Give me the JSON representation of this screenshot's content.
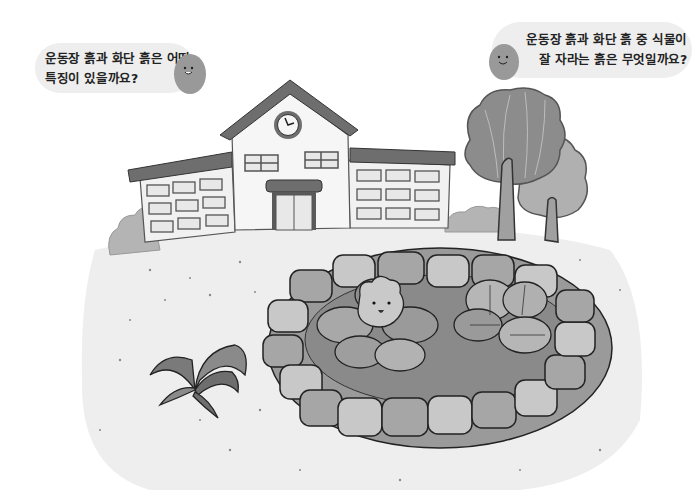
{
  "scene": {
    "description": "School building with a playground and a raised flower bed bordered by stones",
    "colors": {
      "background": "#ffffff",
      "ground": "#eeeeee",
      "bubble": "#eeeeee",
      "roof": "#6e6e6e",
      "wall": "#f4f4f4",
      "soil": "#8a8a8a",
      "stone_light": "#c8c8c8",
      "stone_mid": "#a6a6a6",
      "tree_dark": "#8c8c8c",
      "tree_light": "#b0b0b0",
      "leaf": "#9a9a9a",
      "outline": "#2a2a2a"
    }
  },
  "bubbles": {
    "left": {
      "lines": [
        "운동장 흙과 화단 흙은 어떤",
        "특징이 있을까요?"
      ]
    },
    "right": {
      "lines": [
        "운동장 흙과 화단 흙 중 식물이",
        "잘 자라는 흙은 무엇일까요?"
      ]
    }
  }
}
